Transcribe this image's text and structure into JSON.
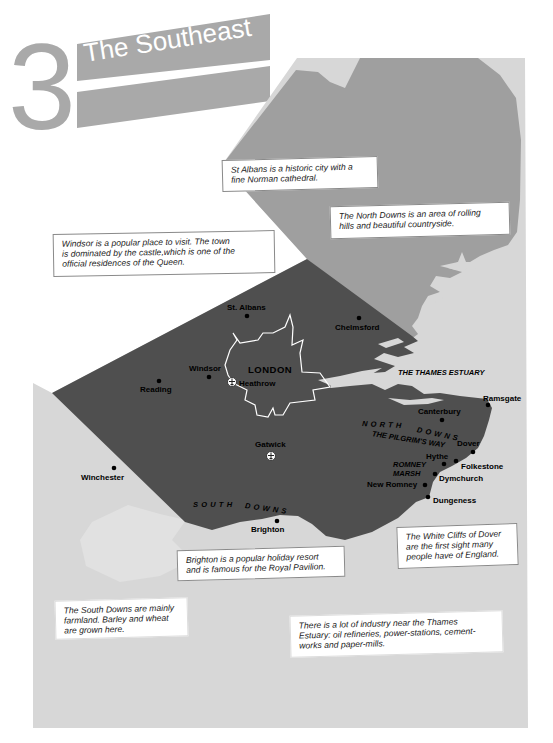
{
  "title": {
    "chapter_number": "3",
    "text": "The Southeast"
  },
  "map": {
    "capital": "LONDON",
    "cities": [
      {
        "name": "St. Albans"
      },
      {
        "name": "Chelmsford"
      },
      {
        "name": "Windsor"
      },
      {
        "name": "Reading"
      },
      {
        "name": "Winchester"
      },
      {
        "name": "Brighton"
      },
      {
        "name": "Canterbury"
      },
      {
        "name": "Ramsgate"
      },
      {
        "name": "Dover"
      },
      {
        "name": "Hythe"
      },
      {
        "name": "Folkestone"
      },
      {
        "name": "Dymchurch"
      },
      {
        "name": "New Romney"
      },
      {
        "name": "Dungeness"
      }
    ],
    "airports": [
      {
        "name": "Heathrow",
        "icon": "airport-icon"
      },
      {
        "name": "Gatwick",
        "icon": "airport-icon"
      }
    ],
    "regions": {
      "thames_estuary": "THE THAMES ESTUARY",
      "north_downs": [
        "NORTH",
        "DOWNS"
      ],
      "pilgrims_way": "THE PILGRIM'S WAY",
      "romney_marsh": [
        "ROMNEY",
        "MARSH"
      ],
      "south_downs": [
        "SOUTH",
        "DOWNS"
      ]
    }
  },
  "info_boxes": [
    {
      "id": "st-albans",
      "lines": [
        "St Albans is a historic city with a",
        "fine Norman cathedral."
      ]
    },
    {
      "id": "north-downs",
      "lines": [
        "The North Downs is an area of rolling",
        "hills and beautiful countryside."
      ]
    },
    {
      "id": "windsor",
      "lines": [
        "Windsor is a popular place to visit. The town",
        "is dominated by the castle,which is one of the",
        "official residences of the Queen."
      ]
    },
    {
      "id": "brighton",
      "lines": [
        "Brighton is a popular holiday resort",
        "and is famous for the Royal Pavilion."
      ]
    },
    {
      "id": "white-cliffs",
      "lines": [
        "The White Cliffs of Dover",
        "are the first sight many",
        "people have of England."
      ]
    },
    {
      "id": "south-downs",
      "lines": [
        "The South Downs are mainly",
        "farmland. Barley and wheat",
        "are grown here."
      ]
    },
    {
      "id": "thames-industry",
      "lines": [
        "There is a lot of industry near the Thames",
        "Estuary: oil refineries, power-stations, cement-",
        "works and paper-mills."
      ]
    }
  ],
  "colors": {
    "page": "#ffffff",
    "sea": "#d7d7d7",
    "land-north": "#9f9f9f",
    "land-south": "#4f4f4f",
    "title": "#a9a9a9",
    "ink": "#111111"
  }
}
